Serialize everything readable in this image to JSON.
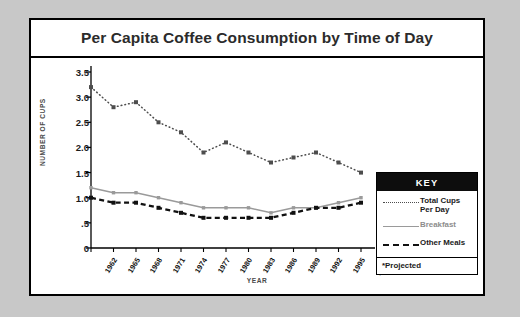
{
  "chart_data": {
    "type": "line",
    "title": "Per Capita Coffee Consumption by Time of Day",
    "xlabel": "YEAR",
    "ylabel": "NUMBER OF CUPS",
    "categories": [
      "1962",
      "1965",
      "1968",
      "1971",
      "1974",
      "1977",
      "1980",
      "1983",
      "1986",
      "1989",
      "1992",
      "1995",
      "1998*"
    ],
    "ytick_labels": [
      "3.5",
      "3.0",
      "2.5",
      "2.0",
      "1.5",
      "1.0",
      ".5",
      "0"
    ],
    "ytick_values": [
      3.5,
      3.0,
      2.5,
      2.0,
      1.5,
      1.0,
      0.5,
      0
    ],
    "ylim": [
      0,
      3.5
    ],
    "grid": false,
    "legend_position": "right",
    "series": [
      {
        "name": "Total Cups Per Day",
        "style": "dotted",
        "color": "#4d4d4d",
        "values": [
          3.2,
          2.8,
          2.9,
          2.5,
          2.3,
          1.9,
          2.1,
          1.9,
          1.7,
          1.8,
          1.9,
          1.7,
          1.5
        ]
      },
      {
        "name": "Breakfast",
        "style": "solid",
        "color": "#9a9a9a",
        "values": [
          1.2,
          1.1,
          1.1,
          1.0,
          0.9,
          0.8,
          0.8,
          0.8,
          0.7,
          0.8,
          0.8,
          0.9,
          1.0
        ]
      },
      {
        "name": "Other Meals",
        "style": "dashed",
        "color": "#111111",
        "values": [
          1.0,
          0.9,
          0.9,
          0.8,
          0.7,
          0.6,
          0.6,
          0.6,
          0.6,
          0.7,
          0.8,
          0.8,
          0.9
        ]
      }
    ],
    "footnote": "*Projected"
  },
  "key": {
    "header": "KEY",
    "rows": [
      {
        "label": "Total Cups\nPer Day"
      },
      {
        "label": "Breakfast"
      },
      {
        "label": "Other Meals"
      }
    ],
    "footnote": "*Projected"
  }
}
